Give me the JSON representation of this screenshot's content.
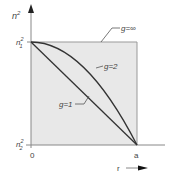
{
  "diagram": {
    "y_axis_label": "n",
    "y_axis_label_sup": "2",
    "y_tick_top": "n",
    "y_tick_top_sub": "1",
    "y_tick_top_sup": "2",
    "y_tick_bottom": "n",
    "y_tick_bottom_sub": "2",
    "y_tick_bottom_sup": "2",
    "x_origin_label": "0",
    "x_end_label": "a",
    "x_axis_label": "r",
    "curves": [
      {
        "label": "g=∞",
        "shape": "step"
      },
      {
        "label": "g=2",
        "shape": "parabolic"
      },
      {
        "label": "g=1",
        "shape": "linear"
      }
    ],
    "colors": {
      "fill": "#e8e8e8",
      "line": "#333333",
      "axis": "#888888",
      "text": "#444444"
    }
  }
}
